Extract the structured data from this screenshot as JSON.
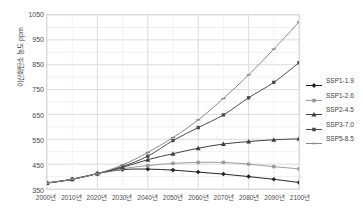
{
  "chart_data": {
    "type": "line",
    "title": "",
    "xlabel": "",
    "ylabel": "이산화탄소 농도 ppm",
    "x": [
      2000,
      2010,
      2020,
      2030,
      2040,
      2050,
      2060,
      2070,
      2080,
      2090,
      2100
    ],
    "categories": [
      "2000년",
      "2010년",
      "2020년",
      "2030년",
      "2040년",
      "2050년",
      "2060년",
      "2070년",
      "2080년",
      "2090년",
      "2100년"
    ],
    "xlim": [
      2000,
      2100
    ],
    "ylim": [
      350,
      1050
    ],
    "yticks": [
      350,
      450,
      550,
      650,
      750,
      850,
      950,
      1050
    ],
    "ytick_labels": [
      "350",
      "450",
      "550",
      "650",
      "750",
      "850",
      "950",
      "1050"
    ],
    "grid": true,
    "legend_position": "right",
    "series": [
      {
        "name": "SSP1-1.9",
        "marker": "diamond",
        "color": "#222222",
        "values": [
          374,
          389,
          412,
          428,
          430,
          426,
          418,
          410,
          400,
          389,
          376
        ]
      },
      {
        "name": "SSP1-2.6",
        "marker": "square",
        "color": "#9a9a9a",
        "values": [
          374,
          389,
          412,
          432,
          444,
          453,
          457,
          457,
          450,
          440,
          431
        ]
      },
      {
        "name": "SSP2-4.5",
        "marker": "triangle",
        "color": "#3f3f3f",
        "values": [
          374,
          389,
          412,
          437,
          468,
          492,
          514,
          531,
          541,
          548,
          552
        ]
      },
      {
        "name": "SSP3-7.0",
        "marker": "square",
        "color": "#4a4a4a",
        "values": [
          374,
          389,
          412,
          441,
          482,
          545,
          597,
          648,
          717,
          779,
          858
        ]
      },
      {
        "name": "SSP5-8.5",
        "marker": "dash",
        "color": "#8a8a8a",
        "values": [
          374,
          389,
          412,
          447,
          497,
          557,
          628,
          714,
          809,
          913,
          1022
        ]
      }
    ]
  },
  "legend": {
    "items": [
      {
        "label": "SSP1-1.9"
      },
      {
        "label": "SSP1-2.6"
      },
      {
        "label": "SSP2-4.5"
      },
      {
        "label": "SSP3-7.0"
      },
      {
        "label": "SSP5-8.5"
      }
    ]
  }
}
